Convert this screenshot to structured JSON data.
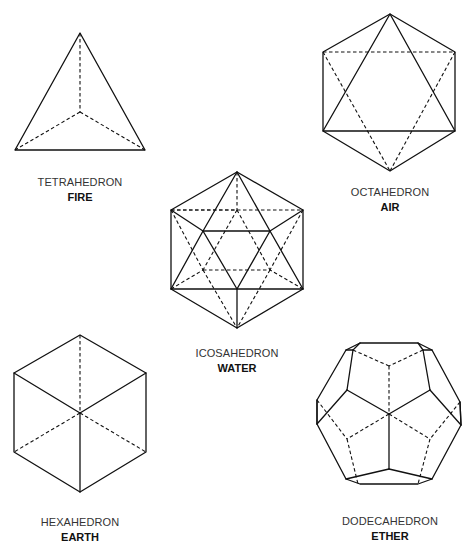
{
  "diagram": {
    "solids": [
      {
        "id": "tetrahedron",
        "name": "TETRAHEDRON",
        "element": "FIRE",
        "label_center": [
          80,
          182
        ]
      },
      {
        "id": "octahedron",
        "name": "OCTAHEDRON",
        "element": "AIR",
        "label_center": [
          390,
          192
        ]
      },
      {
        "id": "icosahedron",
        "name": "ICOSAHEDRON",
        "element": "WATER",
        "label_center": [
          237,
          353
        ]
      },
      {
        "id": "hexahedron",
        "name": "HEXAHEDRON",
        "element": "EARTH",
        "label_center": [
          80,
          522
        ]
      },
      {
        "id": "dodecahedron",
        "name": "DODECAHEDRON",
        "element": "ETHER",
        "label_center": [
          390,
          521
        ]
      }
    ],
    "colors": {
      "line": "#111111",
      "name_text": "#333333",
      "element_text": "#111111",
      "background": "#ffffff"
    }
  }
}
